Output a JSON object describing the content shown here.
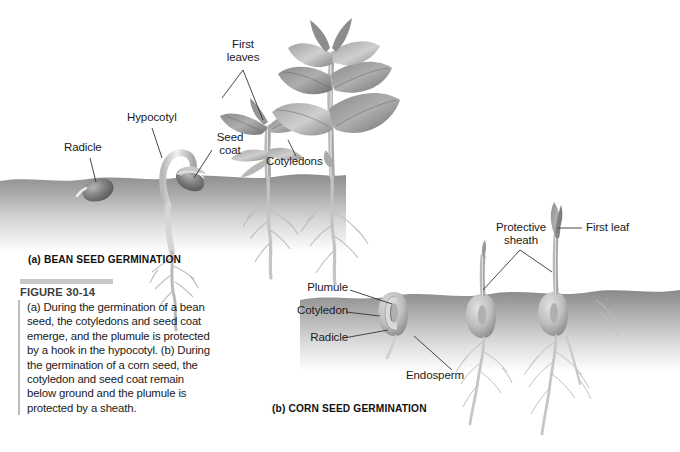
{
  "figure": {
    "number": "FIGURE 30-14",
    "caption": "(a) During the germination of a bean seed, the cotyledons and seed coat emerge, and the plumule is protected by a hook in the hypocotyl. (b) During the germination of a corn seed, the cotyledon and seed coat remain below ground and the plumule is protected by a sheath.",
    "panel_a_caption": "(a) BEAN SEED GERMINATION",
    "panel_b_caption": "(b) CORN SEED GERMINATION"
  },
  "panel_a": {
    "title": "BEAN SEED GERMINATION",
    "labels": [
      {
        "id": "radicle",
        "text": "Radicle"
      },
      {
        "id": "hypocotyl",
        "text": "Hypocotyl"
      },
      {
        "id": "first-leaves",
        "text": "First\nleaves"
      },
      {
        "id": "seed-coat",
        "text": "Seed\ncoat"
      },
      {
        "id": "cotyledons",
        "text": "Cotyledons"
      }
    ]
  },
  "panel_b": {
    "title": "CORN SEED GERMINATION",
    "labels": [
      {
        "id": "plumule",
        "text": "Plumule"
      },
      {
        "id": "cotyledon",
        "text": "Cotyledon"
      },
      {
        "id": "radicle",
        "text": "Radicle"
      },
      {
        "id": "endosperm",
        "text": "Endosperm"
      },
      {
        "id": "protective-sheath",
        "text": "Protective\nsheath"
      },
      {
        "id": "first-leaf",
        "text": "First leaf"
      }
    ]
  },
  "colors": {
    "background": "#ffffff",
    "text": "#1a1a1a",
    "rule": "#bdbdbd",
    "caption_number": "#3d3d3d",
    "soil_dark": "#8e8e8e",
    "soil_light": "#f2f2f2",
    "plant_mid": "#9a9a9a",
    "plant_dark": "#5f5f5f",
    "leader_line": "#333333"
  }
}
